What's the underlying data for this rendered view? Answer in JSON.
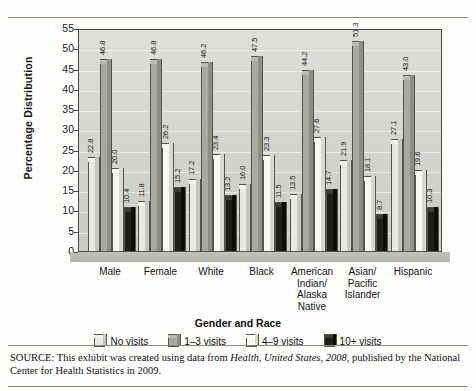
{
  "chart_data": {
    "type": "bar",
    "title": "",
    "xlabel": "Gender and Race",
    "ylabel": "Percentage Distribution",
    "ylim": [
      0,
      55
    ],
    "yticks": [
      0,
      5,
      10,
      15,
      20,
      25,
      30,
      35,
      40,
      45,
      50,
      55
    ],
    "grid": true,
    "legend_position": "bottom",
    "categories": [
      "Male",
      "Female",
      "White",
      "Black",
      "American Indian/ Alaska Native",
      "Asian/ Pacific Islander",
      "Hispanic"
    ],
    "category_lines": [
      [
        "Male"
      ],
      [
        "Female"
      ],
      [
        "White"
      ],
      [
        "Black"
      ],
      [
        "American",
        "Indian/",
        "Alaska",
        "Native"
      ],
      [
        "Asian/",
        "Pacific",
        "Islander"
      ],
      [
        "Hispanic"
      ]
    ],
    "series": [
      {
        "name": "No visits",
        "color": "#e8e8e4",
        "values": [
          22.8,
          11.8,
          17.2,
          16.0,
          13.5,
          21.9,
          27.1
        ]
      },
      {
        "name": "1–3 visits",
        "color": "#a9a9a4",
        "values": [
          46.8,
          46.8,
          46.2,
          47.5,
          44.2,
          51.3,
          43.0
        ]
      },
      {
        "name": "4–9 visits",
        "color": "#f7f7f3",
        "values": [
          20.0,
          26.2,
          23.4,
          23.3,
          27.6,
          18.1,
          19.6
        ]
      },
      {
        "name": "10+ visits",
        "color": "#1e1e1c",
        "values": [
          10.4,
          15.2,
          13.2,
          11.5,
          14.7,
          8.7,
          10.3
        ]
      }
    ],
    "value_labels": [
      [
        "22.8",
        "46.8",
        "20.0",
        "10.4"
      ],
      [
        "11.8",
        "46.8",
        "26.2",
        "15.2"
      ],
      [
        "17.2",
        "46.2",
        "23.4",
        "13.2"
      ],
      [
        "16.0",
        "47.5",
        "23.3",
        "11.5"
      ],
      [
        "13.5",
        "44.2",
        "27.6",
        "14.7"
      ],
      [
        "21.9",
        "51.3",
        "18.1",
        "8.7"
      ],
      [
        "27.1",
        "43.0",
        "19.6",
        "10.3"
      ]
    ]
  },
  "legend": {
    "items": [
      {
        "label": "No visits"
      },
      {
        "label": "1–3 visits"
      },
      {
        "label": "4–9 visits"
      },
      {
        "label": "10+ visits"
      }
    ]
  },
  "source": {
    "prefix": "SOURCE: This exhibit was created using data from ",
    "italic_title": "Health, United States, 2008",
    "suffix": ", published by the National Center for Health Statistics in 2009."
  }
}
